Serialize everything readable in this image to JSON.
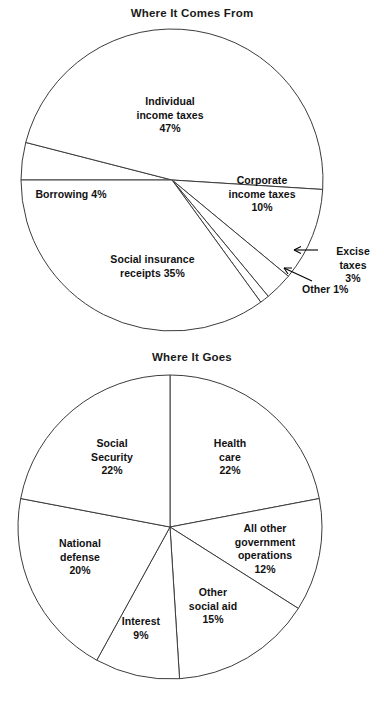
{
  "chart_data": [
    {
      "type": "pie",
      "title": "Where It Comes From",
      "categories": [
        "Individual income taxes",
        "Corporate income taxes",
        "Excise taxes",
        "Other",
        "Social insurance receipts",
        "Borrowing"
      ],
      "values": [
        47,
        10,
        3,
        1,
        35,
        4
      ],
      "units": "percent",
      "legend": "none",
      "labels": [
        {
          "text": "Individual\nincome taxes\n47%",
          "x": 170,
          "y": 95,
          "callout": false
        },
        {
          "text": "Corporate\nincome taxes\n10%",
          "x": 262,
          "y": 174,
          "callout": false
        },
        {
          "text": "Excise taxes\n3%",
          "x": 353,
          "y": 250,
          "callout": true
        },
        {
          "text": "Other 1%",
          "x": 340,
          "y": 285,
          "callout": true
        },
        {
          "text": "Social insurance\nreceipts 35%",
          "x": 152,
          "y": 258,
          "callout": false
        },
        {
          "text": "Borrowing 4%",
          "x": 70,
          "y": 190,
          "callout": false
        }
      ]
    },
    {
      "type": "pie",
      "title": "Where It Goes",
      "categories": [
        "Health care",
        "All other government operations",
        "Other social aid",
        "Interest",
        "National defense",
        "Social Security"
      ],
      "values": [
        22,
        12,
        15,
        9,
        20,
        22
      ],
      "units": "percent",
      "legend": "none",
      "labels": [
        {
          "text": "Health\ncare\n22%",
          "x": 230,
          "y": 443,
          "callout": false
        },
        {
          "text": "All other\ngovernment\noperations\n12%",
          "x": 265,
          "y": 527,
          "callout": false
        },
        {
          "text": "Other\nsocial aid\n15%",
          "x": 213,
          "y": 594,
          "callout": false
        },
        {
          "text": "Interest\n9%",
          "x": 141,
          "y": 622,
          "callout": false
        },
        {
          "text": "National\ndefense\n20%",
          "x": 80,
          "y": 545,
          "callout": false
        },
        {
          "text": "Social\nSecurity\n22%",
          "x": 111,
          "y": 443,
          "callout": false
        }
      ]
    }
  ],
  "charts": {
    "comes_from": {
      "title": "Where It Comes From",
      "slices": {
        "individual": "Individual\nincome taxes\n47%",
        "corporate": "Corporate\nincome taxes\n10%",
        "excise": "Excise taxes\n3%",
        "other": "Other 1%",
        "social_insurance": "Social insurance\nreceipts 35%",
        "borrowing": "Borrowing 4%"
      }
    },
    "where_goes": {
      "title": "Where It Goes",
      "slices": {
        "health_care": "Health\ncare\n22%",
        "all_other_gov": "All other\ngovernment\noperations\n12%",
        "other_social_aid": "Other\nsocial aid\n15%",
        "interest": "Interest\n9%",
        "national_defense": "National\ndefense\n20%",
        "social_security": "Social\nSecurity\n22%"
      }
    }
  },
  "colors": {
    "background": "#ffffff",
    "stroke": "#3c3c3c",
    "text": "#111111"
  }
}
